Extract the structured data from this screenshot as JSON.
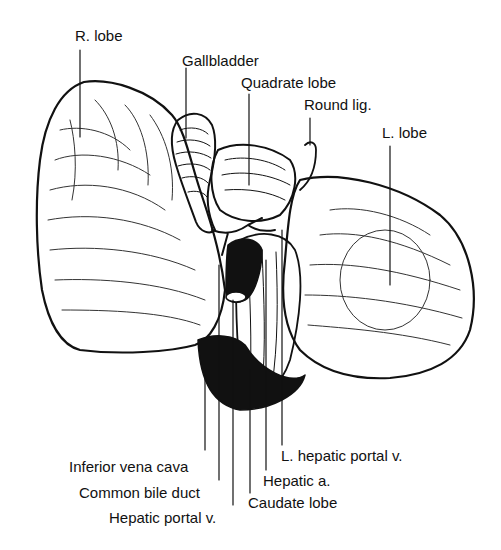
{
  "figure": {
    "labels": {
      "r_lobe": "R. lobe",
      "gallbladder": "Gallbladder",
      "quadrate_lobe": "Quadrate lobe",
      "round_lig": "Round lig.",
      "l_lobe": "L. lobe",
      "l_hepatic_portal_v": "L. hepatic portal v.",
      "hepatic_a": "Hepatic a.",
      "caudate_lobe": "Caudate lobe",
      "inferior_vena_cava": "Inferior vena cava",
      "common_bile_duct": "Common bile duct",
      "hepatic_portal_v": "Hepatic portal v."
    }
  }
}
